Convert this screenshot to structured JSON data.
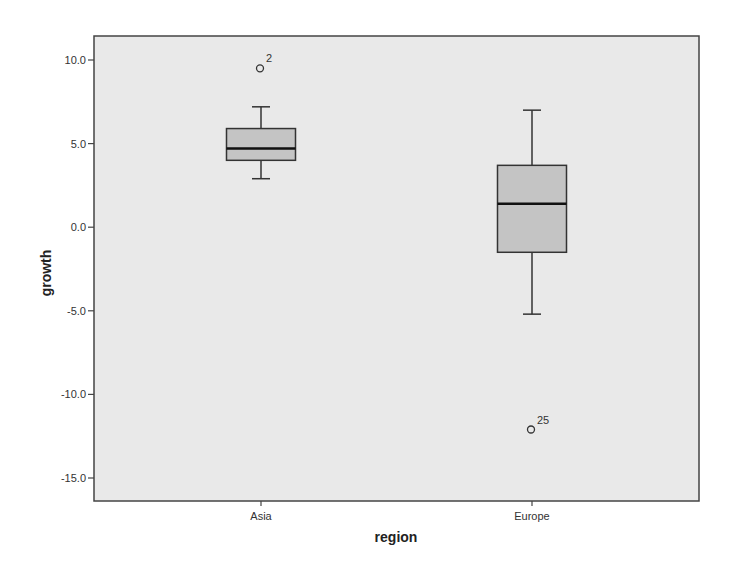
{
  "chart_data": {
    "type": "boxplot",
    "title": "",
    "xlabel": "region",
    "ylabel": "growth",
    "ylim": [
      -16.4,
      11.4
    ],
    "yticks": [
      10.0,
      5.0,
      0.0,
      -5.0,
      -10.0,
      -15.0
    ],
    "ytick_labels": [
      "10.0",
      "5.0",
      "0.0",
      "-5.0",
      "-10.0",
      "-15.0"
    ],
    "categories": [
      "Asia",
      "Europe"
    ],
    "grid": false,
    "legend": null,
    "series": [
      {
        "name": "Asia",
        "whisker_low": 2.9,
        "q1": 4.0,
        "median": 4.7,
        "q3": 5.9,
        "whisker_high": 7.2,
        "outliers": [
          {
            "value": 9.5,
            "label": "2"
          }
        ]
      },
      {
        "name": "Europe",
        "whisker_low": -5.2,
        "q1": -1.5,
        "median": 1.4,
        "q3": 3.7,
        "whisker_high": 7.0,
        "outliers": [
          {
            "value": -12.1,
            "label": "25"
          }
        ]
      }
    ],
    "colors": {
      "plot_background": "#e9e9e9",
      "box_fill": "#c4c4c4",
      "line": "#333333",
      "median": "#111111"
    }
  }
}
